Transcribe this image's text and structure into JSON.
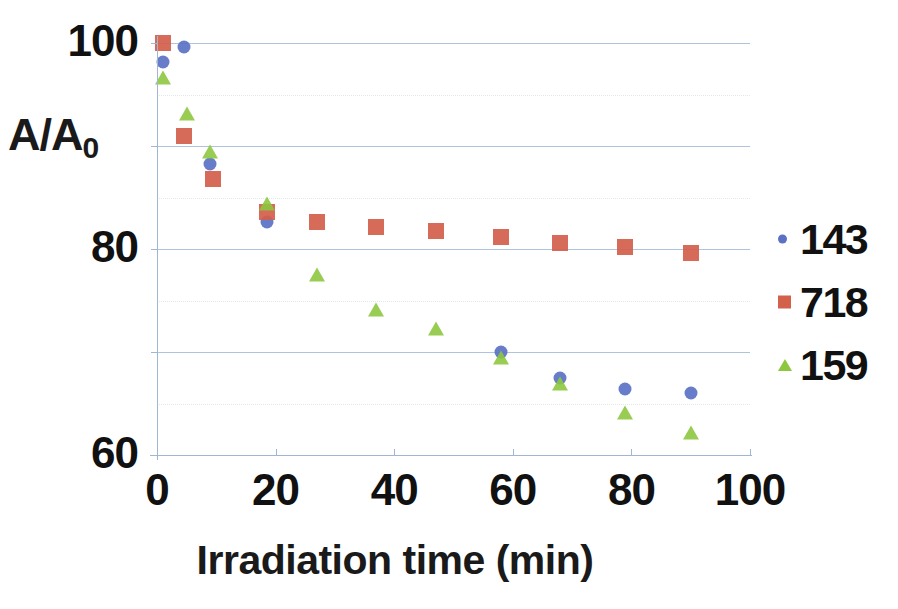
{
  "chart_data": {
    "type": "scatter",
    "title": "",
    "xlabel": "Irradiation time (min)",
    "ylabel": "A/A0",
    "ylabel_main": "A/A",
    "ylabel_sub": "0",
    "xlim": [
      0,
      100
    ],
    "ylim": [
      60,
      100
    ],
    "xticks": [
      "0",
      "20",
      "40",
      "60",
      "80",
      "100"
    ],
    "xtick_values": [
      0,
      20,
      40,
      60,
      80,
      100
    ],
    "yticks": [
      "100",
      "80",
      "60"
    ],
    "ytick_values": [
      100,
      80,
      60
    ],
    "grid": "horizontal",
    "gridlines_major": [
      100,
      90,
      80,
      70,
      60
    ],
    "gridlines_minor": [
      95,
      85,
      75,
      65
    ],
    "legend_position": "right",
    "colors": {
      "series_143": "#5b72c4",
      "series_718": "#d2604b",
      "series_159": "#8dc63f",
      "gridline": "#aec4de",
      "axis": "#9fb7d4",
      "text": "#111111"
    },
    "series": [
      {
        "name": "143",
        "marker": "circle",
        "color": "#5b72c4",
        "points": [
          [
            1.0,
            98.2
          ],
          [
            4.5,
            99.6
          ],
          [
            9.0,
            88.3
          ],
          [
            18.5,
            82.6
          ],
          [
            58.0,
            70.0
          ],
          [
            68.0,
            67.5
          ],
          [
            79.0,
            66.4
          ],
          [
            90.0,
            66.0
          ]
        ]
      },
      {
        "name": "718",
        "marker": "square",
        "color": "#d2604b",
        "points": [
          [
            1.0,
            100.0
          ],
          [
            4.5,
            91.0
          ],
          [
            9.5,
            86.8
          ],
          [
            18.5,
            83.6
          ],
          [
            27.0,
            82.6
          ],
          [
            37.0,
            82.1
          ],
          [
            47.0,
            81.7
          ],
          [
            58.0,
            81.2
          ],
          [
            68.0,
            80.6
          ],
          [
            79.0,
            80.2
          ],
          [
            90.0,
            79.6
          ]
        ]
      },
      {
        "name": "159",
        "marker": "triangle",
        "color": "#8dc63f",
        "points": [
          [
            1.0,
            96.5
          ],
          [
            5.0,
            93.0
          ],
          [
            9.0,
            89.3
          ],
          [
            18.5,
            84.3
          ],
          [
            27.0,
            77.4
          ],
          [
            37.0,
            74.0
          ],
          [
            47.0,
            72.1
          ],
          [
            58.0,
            69.3
          ],
          [
            68.0,
            66.8
          ],
          [
            79.0,
            64.0
          ],
          [
            90.0,
            62.0
          ]
        ]
      }
    ]
  },
  "legend": {
    "items": [
      {
        "label": "143",
        "marker": "circle"
      },
      {
        "label": "718",
        "marker": "square"
      },
      {
        "label": "159",
        "marker": "triangle"
      }
    ]
  }
}
